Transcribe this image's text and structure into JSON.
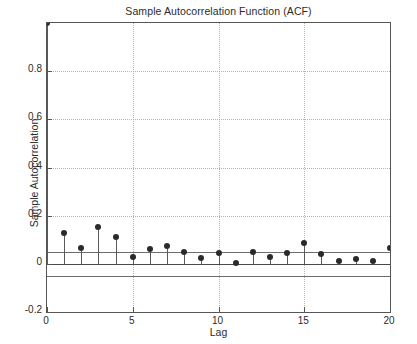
{
  "chart_data": {
    "type": "bar",
    "subtype": "stem",
    "title": "Sample Autocorrelation Function (ACF)",
    "xlabel": "Lag",
    "ylabel": "Sample Autocorrelation",
    "x": [
      0,
      1,
      2,
      3,
      4,
      5,
      6,
      7,
      8,
      9,
      10,
      11,
      12,
      13,
      14,
      15,
      16,
      17,
      18,
      19,
      20
    ],
    "values": [
      1.0,
      0.13,
      0.065,
      0.155,
      0.11,
      0.03,
      0.062,
      0.075,
      0.048,
      0.026,
      0.045,
      0.002,
      0.05,
      0.03,
      0.045,
      0.088,
      0.042,
      0.012,
      0.022,
      0.01,
      0.067
    ],
    "categories": [
      "0",
      "1",
      "2",
      "3",
      "4",
      "5",
      "6",
      "7",
      "8",
      "9",
      "10",
      "11",
      "12",
      "13",
      "14",
      "15",
      "16",
      "17",
      "18",
      "19",
      "20"
    ],
    "xlim": [
      0,
      20
    ],
    "ylim": [
      -0.2,
      1.0
    ],
    "xticks": [
      0,
      5,
      10,
      15,
      20
    ],
    "xtick_labels": [
      "0",
      "5",
      "10",
      "15",
      "20"
    ],
    "yticks": [
      -0.2,
      0,
      0.2,
      0.4,
      0.6,
      0.8
    ],
    "ytick_labels": [
      "-0.2",
      "0",
      "0.2",
      "0.4",
      "0.6",
      "0.8"
    ],
    "grid": true,
    "grid_style": "dotted",
    "legend": null,
    "confidence_bounds": {
      "upper": 0.05,
      "lower": -0.05,
      "label": "approximate 95% confidence bounds"
    },
    "baseline": 0,
    "colors": {
      "marker": "#2a2a2a",
      "stem": "#5a5a5a",
      "bound": "#6d6d6d",
      "grid": "#b4b4b4",
      "axis": "#555555",
      "text": "#2b2b2b",
      "background": "#ffffff"
    }
  }
}
